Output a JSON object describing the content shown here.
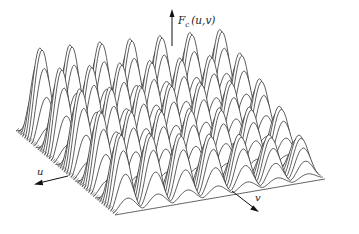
{
  "chart_data": {
    "type": "surface",
    "title": "",
    "function_label": "F_c (u,v)",
    "axes": {
      "z_label_main": "F",
      "z_label_sub": "c",
      "z_label_args": "(u,v)",
      "u_label": "u",
      "v_label": "v"
    },
    "surface": {
      "description": "Periodic cosine-product surface drawn as hidden-line wireframe slices",
      "peaks_along_u": 7,
      "peaks_along_v": 5,
      "u_range": [
        0,
        1
      ],
      "v_range": [
        0,
        1
      ],
      "z_range": [
        0,
        1
      ],
      "num_slices": 46,
      "amplitude_decay_toward_front": true
    },
    "colors": {
      "line": "#2a2a2a",
      "background": "#ffffff"
    }
  }
}
